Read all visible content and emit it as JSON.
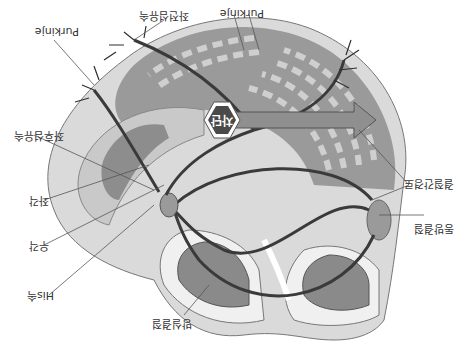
{
  "diagram": {
    "title": "",
    "orientation": "rotated-180",
    "colors": {
      "background": "#ffffff",
      "heart_outer": "#d9d9d9",
      "heart_inner": "#bdbdbd",
      "chamber": "#8c8c8c",
      "ventricle_stripes_dark": "#8a8a8a",
      "ventricle_stripes_light": "#c8c8c8",
      "conduction_path": "#3a3a3a",
      "arrow": "#8f8f8f",
      "block_hexagon": "#4a4a4a"
    },
    "labels": {
      "sa_node": "동방결절",
      "internodal": "결절간경로",
      "av_node": "방실결절",
      "his_bundle": "His속",
      "right_bundle": "우각",
      "left_bundle": "좌각",
      "left_posterior_fascicle": "좌후섬유속",
      "left_anterior_fascicle": "좌전섬유속",
      "purkinje_right": "Purkinje",
      "purkinje_left": "Purkinje",
      "block": "차단"
    }
  }
}
